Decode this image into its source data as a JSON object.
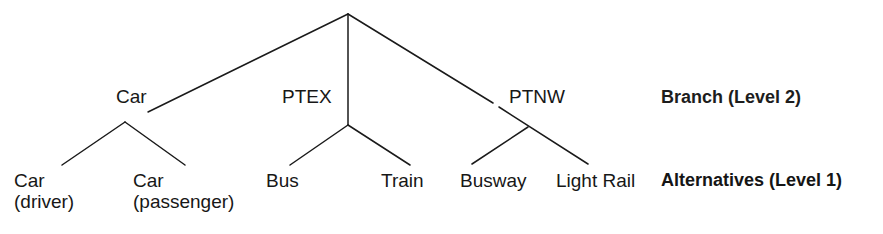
{
  "diagram": {
    "background_color": "#ffffff",
    "line_color": "#1a1a1a",
    "text_color": "#171717",
    "root": {
      "name": "root-node",
      "x": 348,
      "y": 14
    },
    "branches": [
      {
        "id": "car",
        "label": "Car",
        "label_x": 116,
        "label_y": 86,
        "node_x": 125,
        "node_y": 122,
        "link_end_x": 148,
        "link_end_y": 112
      },
      {
        "id": "ptex",
        "label": "PTEX",
        "label_x": 282,
        "label_y": 86,
        "node_x": 348,
        "node_y": 125,
        "link_end_x": 348,
        "link_end_y": 125
      },
      {
        "id": "ptnw",
        "label": "PTNW",
        "label_x": 509,
        "label_y": 86,
        "node_x": 528,
        "node_y": 127,
        "link_end_x": 493,
        "link_end_y": 103
      }
    ],
    "alternatives": [
      {
        "id": "car-driver",
        "line1": "Car",
        "line2": "(driver)",
        "label_x": 14,
        "label_y": 170,
        "tip_x": 62,
        "tip_y": 165,
        "parent": "car"
      },
      {
        "id": "car-passenger",
        "line1": "Car",
        "line2": "(passenger)",
        "label_x": 133,
        "label_y": 170,
        "tip_x": 185,
        "tip_y": 165,
        "parent": "car"
      },
      {
        "id": "bus",
        "line1": "Bus",
        "line2": "",
        "label_x": 266,
        "label_y": 170,
        "tip_x": 290,
        "tip_y": 165,
        "parent": "ptex"
      },
      {
        "id": "train",
        "line1": "Train",
        "line2": "",
        "label_x": 381,
        "label_y": 170,
        "tip_x": 410,
        "tip_y": 165,
        "parent": "ptex"
      },
      {
        "id": "busway",
        "line1": "Busway",
        "line2": "",
        "label_x": 460,
        "label_y": 170,
        "tip_x": 472,
        "tip_y": 164,
        "parent": "ptnw"
      },
      {
        "id": "light-rail",
        "line1": "Light Rail",
        "line2": "",
        "label_x": 556,
        "label_y": 170,
        "tip_x": 588,
        "tip_y": 164,
        "parent": "ptnw"
      }
    ],
    "level_captions": [
      {
        "id": "branch-level-2",
        "text": "Branch (Level 2)",
        "x": 661,
        "y": 87
      },
      {
        "id": "alternatives-level-1",
        "text": "Alternatives (Level 1)",
        "x": 661,
        "y": 170
      }
    ]
  }
}
